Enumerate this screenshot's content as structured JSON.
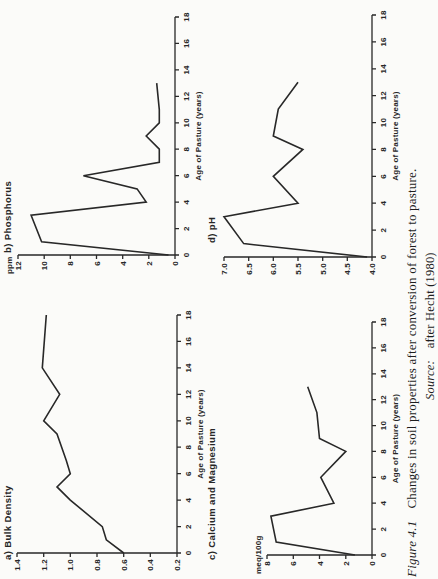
{
  "figure": {
    "caption_label": "Figure 4.1",
    "caption_text": "Changes in soil properties after conversion of forest to pasture.",
    "source_label": "Source:",
    "source_text": "after Hecht (1980)",
    "ink_color": "#282828",
    "paper_color": "#fbfbf9"
  },
  "chart_data": [
    {
      "id": "bulk-density",
      "type": "line",
      "title": "a) Bulk Density",
      "xlabel": "Age of Pasture (years)",
      "ylabel": "",
      "xlim": [
        0,
        18
      ],
      "ylim": [
        0.2,
        1.4
      ],
      "xticks": [
        0,
        2,
        4,
        6,
        8,
        10,
        12,
        14,
        16,
        18
      ],
      "yticks": [
        0.2,
        0.4,
        0.6,
        0.8,
        1.0,
        1.2,
        1.4
      ],
      "ydecimals": 1,
      "grid": false,
      "x": [
        0,
        1,
        2,
        4,
        5,
        6,
        7,
        9,
        10,
        12,
        14,
        18
      ],
      "y": [
        0.6,
        0.73,
        0.76,
        1.0,
        1.1,
        1.0,
        1.03,
        1.1,
        1.2,
        1.08,
        1.21,
        1.18
      ]
    },
    {
      "id": "phosphorus",
      "type": "line",
      "title": "b) Phosphorus",
      "xlabel": "Age of Pasture (years)",
      "ylabel": "ppm",
      "xlim": [
        0,
        18
      ],
      "ylim": [
        0,
        12
      ],
      "xticks": [
        0,
        2,
        4,
        6,
        8,
        10,
        12,
        14,
        16,
        18
      ],
      "yticks": [
        0,
        2,
        4,
        6,
        8,
        10,
        12
      ],
      "ydecimals": 0,
      "grid": false,
      "x": [
        0,
        1,
        3,
        4,
        5,
        6,
        7,
        8,
        9,
        10,
        11,
        13
      ],
      "y": [
        0.5,
        10.2,
        11.0,
        2.2,
        2.9,
        7.0,
        1.2,
        1.2,
        2.2,
        1.2,
        1.2,
        1.4
      ]
    },
    {
      "id": "calcium-magnesium",
      "type": "line",
      "title": "c) Calcium and Magnesium",
      "xlabel": "Age of Pasture (years)",
      "ylabel": "meq/100g",
      "xlim": [
        0,
        18
      ],
      "ylim": [
        0,
        8
      ],
      "xticks": [
        0,
        2,
        4,
        6,
        8,
        10,
        12,
        14,
        16,
        18
      ],
      "yticks": [
        0,
        2,
        4,
        6,
        8
      ],
      "ydecimals": 0,
      "grid": false,
      "x": [
        0,
        1,
        3,
        4,
        6,
        8,
        9,
        11,
        13
      ],
      "y": [
        1.3,
        7.3,
        7.7,
        2.9,
        3.9,
        2.0,
        4.0,
        4.2,
        4.9
      ]
    },
    {
      "id": "ph",
      "type": "line",
      "title": "d) pH",
      "xlabel": "Age of Pasture (years)",
      "ylabel": "",
      "xlim": [
        0,
        18
      ],
      "ylim": [
        4.0,
        7.0
      ],
      "xticks": [
        0,
        2,
        4,
        6,
        8,
        10,
        12,
        14,
        16,
        18
      ],
      "yticks": [
        4.0,
        4.5,
        5.0,
        5.5,
        6.0,
        6.5,
        7.0
      ],
      "ydecimals": 1,
      "grid": false,
      "x": [
        0,
        1,
        3,
        4,
        6,
        8,
        9,
        11,
        13
      ],
      "y": [
        4.1,
        6.6,
        7.0,
        5.5,
        6.0,
        5.4,
        6.0,
        5.9,
        5.5
      ]
    }
  ]
}
